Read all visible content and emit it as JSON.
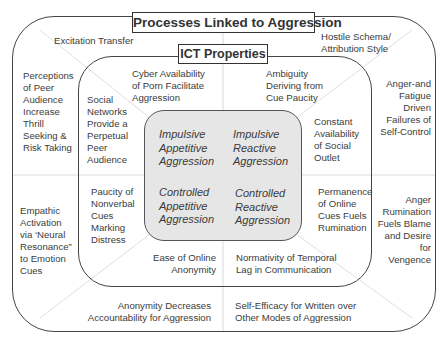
{
  "title": "Processes Linked to Aggression",
  "inner_title": "ICT Properties",
  "outer_processes": {
    "top_left": "Excitation Transfer",
    "top_right": "Hostile Schema/\nAttribution Style",
    "left_upper": "Perceptions\nof Peer\nAudience\nIncrease\nThrill\nSeeking &\nRisk Taking",
    "left_lower": "Empathic\nActivation\nvia ‘Neural\nResonance”\nto Emotion\nCues",
    "right_upper": "Anger-and\nFatigue\nDriven\nFailures of\nSelf-Control",
    "right_lower": "Anger\nRumination\nFuels Blame\nand Desire\nfor\nVengence",
    "bottom_left": "Anonymity Decreases\nAccountability for Aggression",
    "bottom_right": "Self-Efficacy for Written over\nOther Modes of Aggression"
  },
  "ict_properties": {
    "top_left": "Cyber Availability\nof Porn Facilitate\nAggression",
    "top_right": "Ambiguity\nDeriving from\nCue Paucity",
    "left_upper": "Social\nNetworks\nProvide a\nPerpetual\nPeer\nAudience",
    "left_lower": "Paucity of\nNonverbal\nCues\nMarking\nDistress",
    "right_upper": "Constant\nAvailability\nof Social\nOutlet",
    "right_lower": "Permanence\nof Online\nCues Fuels\nRumination",
    "bottom_left": "Ease of Online\nAnonymity",
    "bottom_right": "Normativity of Temporal\nLag in Communication"
  },
  "aggression_types": {
    "impulsive_appetitive": "Impulsive\nAppetitive\nAggression",
    "impulsive_reactive": "Impulsive\nReactive\nAggression",
    "controlled_appetitive": "Controlled\nAppetitive\nAggression",
    "controlled_reactive": "Controlled\nReactive\nAggression"
  },
  "colors": {
    "core_fill": "#e6e6e6",
    "border": "#444444",
    "divider": "#d8d8d8"
  }
}
